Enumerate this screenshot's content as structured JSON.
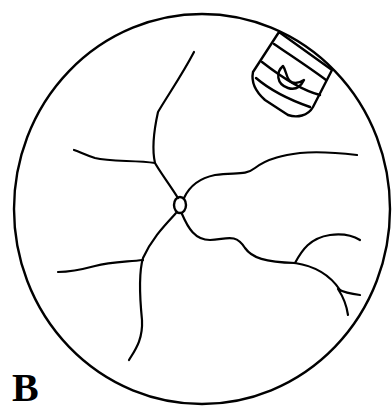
{
  "figure": {
    "panel_label": "B",
    "elements": {
      "fundus_boundary": "circular-field-of-view",
      "optic_disc": "small-oval-disc",
      "vessels": [
        "superior-left-vessel",
        "left-upper-branch",
        "right-upper-vessel",
        "lower-left-vessel",
        "lower-left-branch",
        "lower-right-vessel",
        "lower-right-branch-upper",
        "lower-right-branch-lower"
      ],
      "inset_icon": "striped-badge-with-crescent"
    },
    "colors": {
      "stroke": "#000000",
      "background": "#ffffff"
    }
  }
}
